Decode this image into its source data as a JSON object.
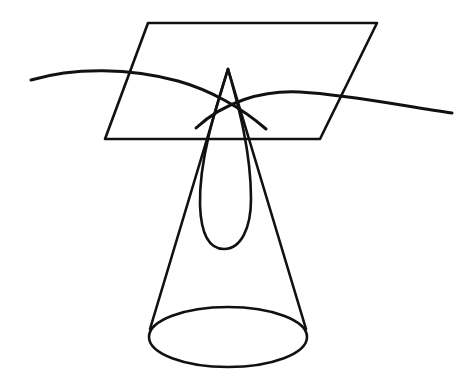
{
  "figure": {
    "background_color": "#ffffff",
    "stroke_color": "#111111",
    "canvas": {
      "width": 475,
      "height": 381
    },
    "parts": [
      {
        "name": "cutting-plane",
        "label": "Cutting plane (parallelogram)"
      },
      {
        "name": "cone-surface",
        "label": "Cone"
      },
      {
        "name": "cone-base-ellipse",
        "label": "Cone base circle"
      },
      {
        "name": "conic-section-curve",
        "label": "Conic section (ellipse) of intersection"
      },
      {
        "name": "sweeping-curve-left",
        "label": "Sweeping curve, left branch"
      },
      {
        "name": "sweeping-curve-right",
        "label": "Sweeping curve, right branch"
      }
    ]
  },
  "chart_data": {
    "type": "diagram",
    "xlabel": "",
    "ylabel": "",
    "xlim": [
      0,
      475
    ],
    "ylim": [
      0,
      381
    ],
    "grid": false,
    "legend": "none",
    "stroke_color": "#111111",
    "background_color": "#ffffff",
    "geometry": {
      "cutting_plane": {
        "shape": "parallelogram",
        "stroke_width": 2.6,
        "points": [
          [
            148,
            23
          ],
          [
            377,
            23
          ],
          [
            320,
            139
          ],
          [
            105,
            139
          ]
        ],
        "path": "M148,23 L377,23 L320,139 L105,139 Z"
      },
      "cone": {
        "apex": [
          228,
          69
        ],
        "base_center": [
          228,
          337
        ],
        "base_rx": 79,
        "base_ry": 30,
        "stroke_width": 2.6,
        "left_side_path": "M228,69 L150,329",
        "right_side_path": "M228,69 L306,329",
        "base_ellipse_path": "M149,337 A79,30 0 1,0 307,337 A79,30 0 1,0 149,337 Z"
      },
      "conic_section": {
        "shape": "teardrop-ellipse",
        "stroke_width": 2.6,
        "apex": [
          228,
          69
        ],
        "bottom": [
          224,
          249
        ],
        "left_extreme": [
          200,
          205
        ],
        "right_extreme": [
          250,
          196
        ],
        "path": "M228,69 C215,110 199,160 200,205 C201,233 209,249 224,249 C241,249 251,228 251,199 C251,152 239,108 228,69 Z"
      },
      "sweeping_curve_left": {
        "stroke_width": 3.0,
        "start": [
          31,
          80
        ],
        "end": [
          266,
          129
        ],
        "control_points": [
          [
            120,
            62
          ],
          [
            210,
            98
          ]
        ],
        "path": "M31,80 C75,67 130,68 178,81 C210,90 242,108 266,129"
      },
      "sweeping_curve_right": {
        "stroke_width": 3.0,
        "start": [
          452,
          113
        ],
        "end": [
          196,
          128
        ],
        "control_points": [
          [
            360,
            96
          ],
          [
            270,
            93
          ]
        ],
        "path": "M452,113 C408,107 352,95 300,92 C262,90 224,102 196,128"
      },
      "crossing_point": [
        233,
        103
      ]
    }
  }
}
